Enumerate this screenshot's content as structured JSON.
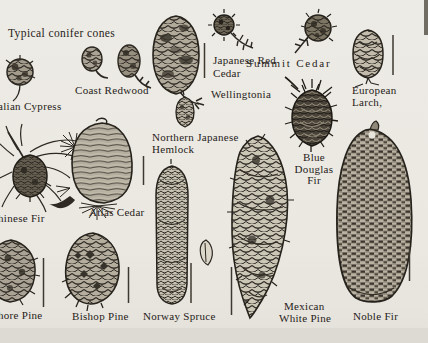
{
  "page": {
    "title": "Typical conifer cones",
    "colors": {
      "paper": "#ebe8e2",
      "ink": "#2b2721"
    }
  },
  "specimens": [
    {
      "lines": [
        "alian Cypress"
      ]
    },
    {
      "lines": [
        "Coast Redwood"
      ]
    },
    {
      "lines": [
        "Wellingtonia"
      ]
    },
    {
      "lines": [
        "Japanese Red",
        "Cedar"
      ]
    },
    {
      "lines": [
        "Summit Cedar"
      ]
    },
    {
      "lines": [
        "European",
        "Larch,"
      ]
    },
    {
      "lines": [
        "Northern Japanese",
        "Hemlock"
      ]
    },
    {
      "lines": [
        "hinese Fir"
      ]
    },
    {
      "lines": [
        "Atlas Cedar"
      ]
    },
    {
      "lines": [
        "Blue",
        "Douglas",
        "Fir"
      ]
    },
    {
      "lines": [
        "hore Pine"
      ]
    },
    {
      "lines": [
        "Bishop Pine"
      ]
    },
    {
      "lines": [
        "Norway Spruce"
      ]
    },
    {
      "lines": [
        "Mexican",
        "White Pine"
      ]
    },
    {
      "lines": [
        "Noble Fir"
      ]
    }
  ]
}
